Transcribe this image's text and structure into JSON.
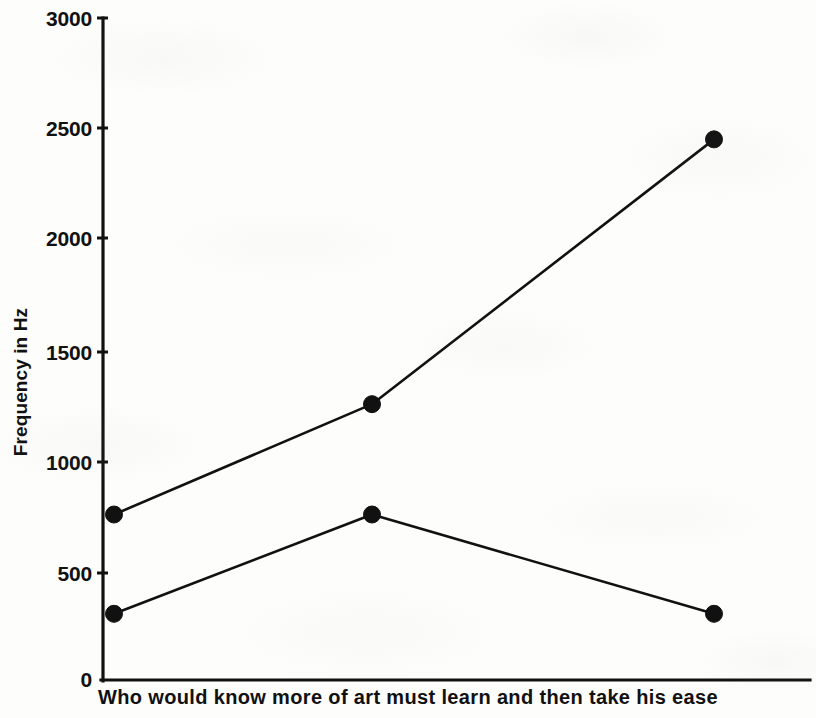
{
  "chart_data": {
    "type": "line",
    "title": "",
    "subtitle": "",
    "xlabel": "Who would know more of art must learn and then take his ease",
    "ylabel": "Frequency in Hz",
    "x": [
      1,
      2,
      3
    ],
    "xtick_labels": [
      "",
      "",
      ""
    ],
    "ylim": [
      0,
      3000
    ],
    "ytick_values": [
      0,
      500,
      1000,
      1500,
      2000,
      2500,
      3000
    ],
    "ytick_labels": [
      "0",
      "500",
      "1000",
      "1500",
      "2000",
      "2500",
      "3000"
    ],
    "grid": false,
    "legend": "none",
    "marker": "filled-circle",
    "series": [
      {
        "name": "upper-contour",
        "values": [
          750,
          1250,
          2450
        ]
      },
      {
        "name": "lower-contour",
        "values": [
          300,
          750,
          300
        ]
      }
    ]
  },
  "axes": {
    "y_axis_title": "Frequency in Hz",
    "x_axis_caption": "Who would know more of art must learn and then take his ease",
    "ticks": {
      "t0": "0",
      "t500": "500",
      "t1000": "1000",
      "t1500": "1500",
      "t2000": "2000",
      "t2500": "2500",
      "t3000": "3000"
    }
  },
  "colors": {
    "ink": "#111111",
    "paper": "#fdfdfb"
  }
}
